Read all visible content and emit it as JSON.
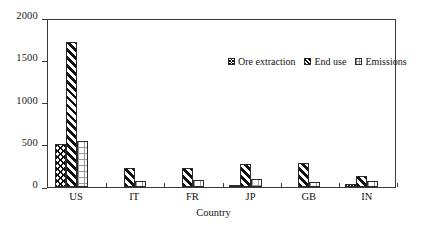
{
  "chart_data": {
    "type": "bar",
    "title": "",
    "xlabel": "Country",
    "ylabel": "",
    "categories": [
      "US",
      "IT",
      "FR",
      "JP",
      "GB",
      "IN"
    ],
    "series": [
      {
        "name": "Ore extraction",
        "pattern": "diamond-hatch",
        "values": [
          510,
          0,
          5,
          15,
          0,
          35
        ]
      },
      {
        "name": "End use",
        "pattern": "diagonal-stripe",
        "values": [
          1720,
          230,
          225,
          270,
          290,
          130
        ]
      },
      {
        "name": "Emissions",
        "pattern": "light-dots",
        "values": [
          550,
          75,
          85,
          95,
          65,
          75
        ]
      }
    ],
    "ylim": [
      0,
      2000
    ],
    "yticks": [
      0,
      500,
      1000,
      1500,
      2000
    ],
    "ytick_labels": [
      "0",
      "500",
      "1000",
      "1500",
      "2000"
    ],
    "grid": false,
    "legend_position": "top-right-inside",
    "frame": true
  },
  "legend": {
    "items": [
      {
        "label": "Ore extraction"
      },
      {
        "label": "End use"
      },
      {
        "label": "Emissions"
      }
    ]
  },
  "axes": {
    "x_title": "Country"
  }
}
